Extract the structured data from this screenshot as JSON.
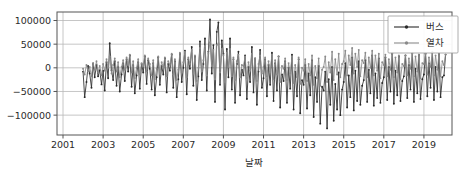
{
  "chart_data": {
    "type": "line",
    "title": "",
    "subtitle": "",
    "xlabel": "날짜",
    "ylabel": "",
    "xtick_labels": [
      "2001",
      "2003",
      "2005",
      "2007",
      "2009",
      "2011",
      "2013",
      "2015",
      "2017",
      "2019"
    ],
    "xtick_values": [
      2001,
      2003,
      2005,
      2007,
      2009,
      2011,
      2013,
      2015,
      2017,
      2019
    ],
    "ytick_labels": [
      "100000",
      "50000",
      "0",
      "−50000",
      "−100000"
    ],
    "ytick_values": [
      100000,
      50000,
      0,
      -50000,
      -100000
    ],
    "xlim": [
      2000.7,
      2020.4
    ],
    "ylim": [
      -142000,
      118000
    ],
    "grid": true,
    "grid_color": "#b8b8b8",
    "legend_position": "upper right",
    "legend": [
      "버스",
      "열차"
    ],
    "series": [
      {
        "name": "버스",
        "color": "#2a2a2a",
        "marker": "circle",
        "x": [
          2002.0,
          2002.08,
          2002.17,
          2002.25,
          2002.33,
          2002.42,
          2002.5,
          2002.58,
          2002.67,
          2002.75,
          2002.83,
          2002.92,
          2003.0,
          2003.08,
          2003.17,
          2003.25,
          2003.33,
          2003.42,
          2003.5,
          2003.58,
          2003.67,
          2003.75,
          2003.83,
          2003.92,
          2004.0,
          2004.08,
          2004.17,
          2004.25,
          2004.33,
          2004.42,
          2004.5,
          2004.58,
          2004.67,
          2004.75,
          2004.83,
          2004.92,
          2005.0,
          2005.08,
          2005.17,
          2005.25,
          2005.33,
          2005.42,
          2005.5,
          2005.58,
          2005.67,
          2005.75,
          2005.83,
          2005.92,
          2006.0,
          2006.08,
          2006.17,
          2006.25,
          2006.33,
          2006.42,
          2006.5,
          2006.58,
          2006.67,
          2006.75,
          2006.83,
          2006.92,
          2007.0,
          2007.08,
          2007.17,
          2007.25,
          2007.33,
          2007.42,
          2007.5,
          2007.58,
          2007.67,
          2007.75,
          2007.83,
          2007.92,
          2008.0,
          2008.08,
          2008.17,
          2008.25,
          2008.33,
          2008.42,
          2008.5,
          2008.58,
          2008.67,
          2008.75,
          2008.83,
          2008.92,
          2009.0,
          2009.08,
          2009.17,
          2009.25,
          2009.33,
          2009.42,
          2009.5,
          2009.58,
          2009.67,
          2009.75,
          2009.83,
          2009.92,
          2010.0,
          2010.08,
          2010.17,
          2010.25,
          2010.33,
          2010.42,
          2010.5,
          2010.58,
          2010.67,
          2010.75,
          2010.83,
          2010.92,
          2011.0,
          2011.08,
          2011.17,
          2011.25,
          2011.33,
          2011.42,
          2011.5,
          2011.58,
          2011.67,
          2011.75,
          2011.83,
          2011.92,
          2012.0,
          2012.08,
          2012.17,
          2012.25,
          2012.33,
          2012.42,
          2012.5,
          2012.58,
          2012.67,
          2012.75,
          2012.83,
          2012.92,
          2013.0,
          2013.08,
          2013.17,
          2013.25,
          2013.33,
          2013.42,
          2013.5,
          2013.58,
          2013.67,
          2013.75,
          2013.83,
          2013.92,
          2014.0,
          2014.08,
          2014.17,
          2014.25,
          2014.33,
          2014.42,
          2014.5,
          2014.58,
          2014.67,
          2014.75,
          2014.83,
          2014.92,
          2015.0,
          2015.08,
          2015.17,
          2015.25,
          2015.33,
          2015.42,
          2015.5,
          2015.58,
          2015.67,
          2015.75,
          2015.83,
          2015.92,
          2016.0,
          2016.08,
          2016.17,
          2016.25,
          2016.33,
          2016.42,
          2016.5,
          2016.58,
          2016.67,
          2016.75,
          2016.83,
          2016.92,
          2017.0,
          2017.08,
          2017.17,
          2017.25,
          2017.33,
          2017.42,
          2017.5,
          2017.58,
          2017.67,
          2017.75,
          2017.83,
          2017.92,
          2018.0,
          2018.08,
          2018.17,
          2018.25,
          2018.33,
          2018.42,
          2018.5,
          2018.58,
          2018.67,
          2018.75,
          2018.83,
          2018.92,
          2019.0,
          2019.08,
          2019.17,
          2019.25,
          2019.33,
          2019.42,
          2019.5,
          2019.58,
          2019.67,
          2019.75,
          2019.83,
          2019.92,
          2020.0,
          2020.08
        ],
        "y": [
          -8000,
          -62000,
          -30000,
          4000,
          -12000,
          -42000,
          9000,
          -20000,
          6000,
          -18000,
          -5000,
          -35000,
          -6000,
          -48000,
          12000,
          -22000,
          52000,
          -5000,
          -26000,
          14000,
          -38000,
          2000,
          -50000,
          -14000,
          10000,
          -28000,
          18000,
          -8000,
          26000,
          -40000,
          6000,
          -54000,
          -16000,
          12000,
          -44000,
          8000,
          -10000,
          24000,
          -34000,
          16000,
          -2000,
          -46000,
          10000,
          -58000,
          -20000,
          22000,
          -36000,
          4000,
          -14000,
          20000,
          -52000,
          8000,
          -6000,
          28000,
          -42000,
          14000,
          -62000,
          -24000,
          30000,
          -30000,
          0,
          36000,
          -56000,
          18000,
          -2000,
          44000,
          -38000,
          24000,
          -68000,
          -18000,
          56000,
          -26000,
          8000,
          62000,
          -48000,
          34000,
          102000,
          -12000,
          48000,
          -72000,
          76000,
          96000,
          -36000,
          58000,
          30000,
          -88000,
          40000,
          -20000,
          62000,
          -46000,
          18000,
          -74000,
          8000,
          34000,
          -58000,
          -4000,
          -16000,
          26000,
          -66000,
          2000,
          -30000,
          44000,
          -52000,
          20000,
          -78000,
          -8000,
          38000,
          -42000,
          -22000,
          18000,
          -60000,
          6000,
          -36000,
          32000,
          -70000,
          10000,
          -48000,
          24000,
          -84000,
          -14000,
          -28000,
          14000,
          -74000,
          0,
          -44000,
          28000,
          -88000,
          -8000,
          -60000,
          18000,
          -96000,
          -26000,
          -36000,
          6000,
          -86000,
          -12000,
          -58000,
          16000,
          -104000,
          -20000,
          -72000,
          4000,
          -118000,
          -40000,
          -48000,
          -8000,
          -128000,
          -24000,
          -78000,
          2000,
          -112000,
          -34000,
          -88000,
          -10000,
          -100000,
          -46000,
          -30000,
          10000,
          -84000,
          -16000,
          -62000,
          22000,
          -90000,
          -6000,
          -70000,
          14000,
          -78000,
          -38000,
          -26000,
          16000,
          -72000,
          -4000,
          -54000,
          26000,
          -80000,
          -12000,
          -64000,
          20000,
          -74000,
          -32000,
          -20000,
          22000,
          -68000,
          2000,
          -50000,
          30000,
          -76000,
          -6000,
          -58000,
          24000,
          -70000,
          -28000,
          -18000,
          26000,
          -64000,
          6000,
          -46000,
          32000,
          -72000,
          -2000,
          -54000,
          28000,
          -66000,
          -24000,
          -14000,
          30000,
          -60000,
          10000,
          -42000,
          34000,
          -68000,
          2000,
          -50000,
          30000,
          -62000,
          -20000,
          -16000,
          28000
        ]
      },
      {
        "name": "열차",
        "color": "#8a8a8a",
        "marker": "circle",
        "x": [
          2002.0,
          2002.08,
          2002.17,
          2002.25,
          2002.33,
          2002.42,
          2002.5,
          2002.58,
          2002.67,
          2002.75,
          2002.83,
          2002.92,
          2003.0,
          2003.08,
          2003.17,
          2003.25,
          2003.33,
          2003.42,
          2003.5,
          2003.58,
          2003.67,
          2003.75,
          2003.83,
          2003.92,
          2004.0,
          2004.08,
          2004.17,
          2004.25,
          2004.33,
          2004.42,
          2004.5,
          2004.58,
          2004.67,
          2004.75,
          2004.83,
          2004.92,
          2005.0,
          2005.08,
          2005.17,
          2005.25,
          2005.33,
          2005.42,
          2005.5,
          2005.58,
          2005.67,
          2005.75,
          2005.83,
          2005.92,
          2006.0,
          2006.08,
          2006.17,
          2006.25,
          2006.33,
          2006.42,
          2006.5,
          2006.58,
          2006.67,
          2006.75,
          2006.83,
          2006.92,
          2007.0,
          2007.08,
          2007.17,
          2007.25,
          2007.33,
          2007.42,
          2007.5,
          2007.58,
          2007.67,
          2007.75,
          2007.83,
          2007.92,
          2008.0,
          2008.08,
          2008.17,
          2008.25,
          2008.33,
          2008.42,
          2008.5,
          2008.58,
          2008.67,
          2008.75,
          2008.83,
          2008.92,
          2009.0,
          2009.08,
          2009.17,
          2009.25,
          2009.33,
          2009.42,
          2009.5,
          2009.58,
          2009.67,
          2009.75,
          2009.83,
          2009.92,
          2010.0,
          2010.08,
          2010.17,
          2010.25,
          2010.33,
          2010.42,
          2010.5,
          2010.58,
          2010.67,
          2010.75,
          2010.83,
          2010.92,
          2011.0,
          2011.08,
          2011.17,
          2011.25,
          2011.33,
          2011.42,
          2011.5,
          2011.58,
          2011.67,
          2011.75,
          2011.83,
          2011.92,
          2012.0,
          2012.08,
          2012.17,
          2012.25,
          2012.33,
          2012.42,
          2012.5,
          2012.58,
          2012.67,
          2012.75,
          2012.83,
          2012.92,
          2013.0,
          2013.08,
          2013.17,
          2013.25,
          2013.33,
          2013.42,
          2013.5,
          2013.58,
          2013.67,
          2013.75,
          2013.83,
          2013.92,
          2014.0,
          2014.08,
          2014.17,
          2014.25,
          2014.33,
          2014.42,
          2014.5,
          2014.58,
          2014.67,
          2014.75,
          2014.83,
          2014.92,
          2015.0,
          2015.08,
          2015.17,
          2015.25,
          2015.33,
          2015.42,
          2015.5,
          2015.58,
          2015.67,
          2015.75,
          2015.83,
          2015.92,
          2016.0,
          2016.08,
          2016.17,
          2016.25,
          2016.33,
          2016.42,
          2016.5,
          2016.58,
          2016.67,
          2016.75,
          2016.83,
          2016.92,
          2017.0,
          2017.08,
          2017.17,
          2017.25,
          2017.33,
          2017.42,
          2017.5,
          2017.58,
          2017.67,
          2017.75,
          2017.83,
          2017.92,
          2018.0,
          2018.08,
          2018.17,
          2018.25,
          2018.33,
          2018.42,
          2018.5,
          2018.58,
          2018.67,
          2018.75,
          2018.83,
          2018.92,
          2019.0,
          2019.08,
          2019.17,
          2019.25,
          2019.33,
          2019.42,
          2019.5,
          2019.58,
          2019.67,
          2019.75,
          2019.83,
          2019.92,
          2020.0,
          2020.08
        ],
        "y": [
          -2000,
          -14000,
          6000,
          -8000,
          2000,
          -18000,
          10000,
          -4000,
          14000,
          -10000,
          4000,
          -16000,
          8000,
          -6000,
          18000,
          0,
          24000,
          -12000,
          6000,
          20000,
          -8000,
          12000,
          -20000,
          2000,
          16000,
          -4000,
          22000,
          6000,
          28000,
          -10000,
          14000,
          -22000,
          0,
          18000,
          -14000,
          10000,
          4000,
          26000,
          -8000,
          20000,
          8000,
          -16000,
          16000,
          -24000,
          -2000,
          24000,
          -12000,
          12000,
          2000,
          22000,
          -18000,
          14000,
          6000,
          30000,
          -14000,
          18000,
          -26000,
          -4000,
          32000,
          -10000,
          12000,
          34000,
          -20000,
          22000,
          8000,
          38000,
          -12000,
          26000,
          -28000,
          0,
          42000,
          -8000,
          16000,
          46000,
          -16000,
          30000,
          54000,
          4000,
          38000,
          -24000,
          48000,
          52000,
          -10000,
          40000,
          26000,
          -30000,
          32000,
          2000,
          40000,
          -18000,
          22000,
          -26000,
          14000,
          28000,
          -20000,
          6000,
          4000,
          24000,
          -22000,
          12000,
          -6000,
          30000,
          -16000,
          20000,
          -28000,
          8000,
          26000,
          -12000,
          2000,
          22000,
          -18000,
          14000,
          -8000,
          28000,
          -24000,
          16000,
          -14000,
          24000,
          -30000,
          4000,
          -2000,
          20000,
          -26000,
          10000,
          -12000,
          24000,
          -32000,
          6000,
          -20000,
          22000,
          -34000,
          0,
          -6000,
          18000,
          -28000,
          8000,
          -16000,
          26000,
          -36000,
          4000,
          -22000,
          20000,
          -38000,
          -4000,
          2000,
          24000,
          -30000,
          12000,
          -10000,
          34000,
          -26000,
          18000,
          -14000,
          30000,
          -20000,
          8000,
          14000,
          36000,
          -16000,
          26000,
          6000,
          42000,
          -12000,
          30000,
          2000,
          38000,
          -18000,
          16000,
          10000,
          32000,
          -20000,
          22000,
          0,
          36000,
          -16000,
          26000,
          -6000,
          30000,
          -22000,
          12000,
          6000,
          28000,
          -18000,
          18000,
          -4000,
          32000,
          -20000,
          22000,
          -10000,
          26000,
          -24000,
          8000,
          4000,
          26000,
          -16000,
          20000,
          -2000,
          30000,
          -18000,
          24000,
          -8000,
          28000,
          -22000,
          10000,
          8000,
          30000,
          -14000,
          22000,
          2000,
          32000,
          -16000,
          26000,
          -4000,
          30000,
          -18000,
          14000,
          6000,
          28000
        ]
      }
    ]
  },
  "axes": {
    "xlabel": "날짜",
    "ylabel": ""
  },
  "legend": {
    "items": [
      {
        "label": "버스",
        "color": "#2a2a2a"
      },
      {
        "label": "열차",
        "color": "#8a8a8a"
      }
    ]
  },
  "colors": {
    "bus": "#2a2a2a",
    "train": "#8a8a8a",
    "grid": "#b8b8b8",
    "spine": "#555555",
    "text": "#2b2b2b",
    "background": "#ffffff"
  }
}
